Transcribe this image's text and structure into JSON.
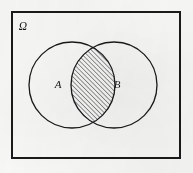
{
  "diagram": {
    "type": "venn-two-set",
    "universe": {
      "name": "universe-rectangle",
      "label": "Ω",
      "label_meaning": "sample-space-omega",
      "x": 12,
      "y": 12,
      "width": 168,
      "height": 146,
      "stroke_color": "#1a1a1a",
      "stroke_width": 2,
      "fill_color": "none",
      "label_x": 23,
      "label_y": 30
    },
    "sets": [
      {
        "id": "set-a",
        "label": "A",
        "cx": 72,
        "cy": 85,
        "r": 43,
        "stroke_color": "#1a1a1a",
        "stroke_width": 1.3,
        "fill_color": "none",
        "label_x": 58,
        "label_y": 88
      },
      {
        "id": "set-b",
        "label": "B",
        "cx": 114,
        "cy": 85,
        "r": 43,
        "stroke_color": "#1a1a1a",
        "stroke_width": 1.3,
        "fill_color": "none",
        "label_x": 117,
        "label_y": 88
      }
    ],
    "shaded_region": {
      "name": "intersection-a-and-b",
      "description": "A ∩ B",
      "fill_pattern": "diagonal-hatch",
      "hatch_direction": "bottom-left-to-top-right",
      "hatch_spacing": 3.2,
      "hatch_stroke_width": 0.9,
      "hatch_color": "#1d1d1d"
    },
    "colors": {
      "ink": "#1a1a1a",
      "paper": "#fbfbfa"
    }
  },
  "chart_data": {
    "type": "diagram",
    "labels": [
      "Ω",
      "A",
      "B"
    ],
    "shaded": [
      "A ∩ B"
    ]
  }
}
